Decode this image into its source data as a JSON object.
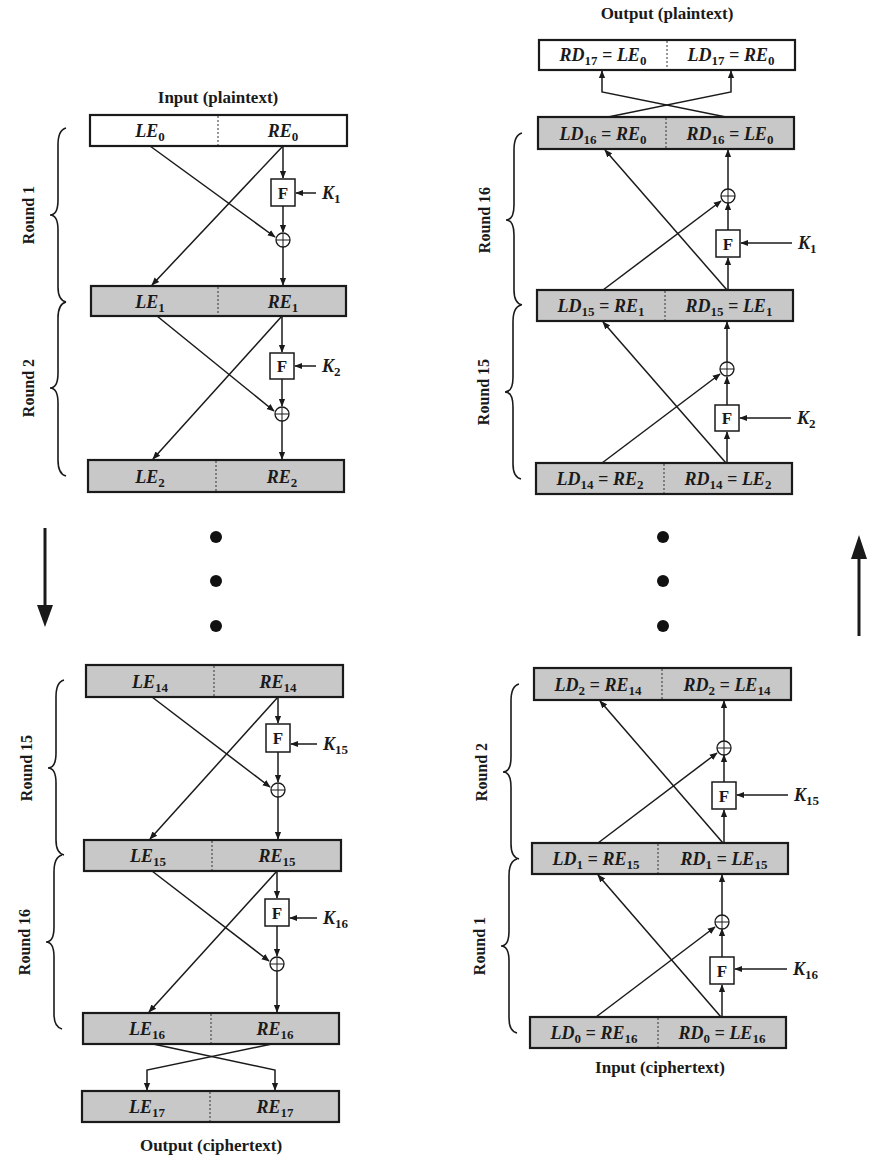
{
  "encryption": {
    "input_label": "Input (plaintext)",
    "output_label": "Output (ciphertext)",
    "direction": "down",
    "blocks": [
      {
        "id": "0",
        "left": "LE",
        "left_sub": "0",
        "right": "RE",
        "right_sub": "0",
        "shaded": false
      },
      {
        "id": "1",
        "left": "LE",
        "left_sub": "1",
        "right": "RE",
        "right_sub": "1",
        "shaded": true
      },
      {
        "id": "2",
        "left": "LE",
        "left_sub": "2",
        "right": "RE",
        "right_sub": "2",
        "shaded": true
      },
      {
        "id": "14",
        "left": "LE",
        "left_sub": "14",
        "right": "RE",
        "right_sub": "14",
        "shaded": true
      },
      {
        "id": "15",
        "left": "LE",
        "left_sub": "15",
        "right": "RE",
        "right_sub": "15",
        "shaded": true
      },
      {
        "id": "16",
        "left": "LE",
        "left_sub": "16",
        "right": "RE",
        "right_sub": "16",
        "shaded": true
      },
      {
        "id": "17",
        "left": "LE",
        "left_sub": "17",
        "right": "RE",
        "right_sub": "17",
        "shaded": true
      }
    ],
    "rounds": [
      {
        "label": "Round 1",
        "key": "K",
        "key_sub": "1"
      },
      {
        "label": "Round 2",
        "key": "K",
        "key_sub": "2"
      },
      {
        "label": "Round 15",
        "key": "K",
        "key_sub": "15"
      },
      {
        "label": "Round 16",
        "key": "K",
        "key_sub": "16"
      }
    ]
  },
  "decryption": {
    "input_label": "Input (ciphertext)",
    "output_label": "Output (plaintext)",
    "direction": "up",
    "blocks": [
      {
        "id": "17",
        "left": "RD",
        "left_sub": "17",
        "left_eq": "LE",
        "left_eq_sub": "0",
        "right": "LD",
        "right_sub": "17",
        "right_eq": "RE",
        "right_eq_sub": "0",
        "shaded": false
      },
      {
        "id": "16",
        "left": "LD",
        "left_sub": "16",
        "left_eq": "RE",
        "left_eq_sub": "0",
        "right": "RD",
        "right_sub": "16",
        "right_eq": "LE",
        "right_eq_sub": "0",
        "shaded": true
      },
      {
        "id": "15",
        "left": "LD",
        "left_sub": "15",
        "left_eq": "RE",
        "left_eq_sub": "1",
        "right": "RD",
        "right_sub": "15",
        "right_eq": "LE",
        "right_eq_sub": "1",
        "shaded": true
      },
      {
        "id": "14",
        "left": "LD",
        "left_sub": "14",
        "left_eq": "RE",
        "left_eq_sub": "2",
        "right": "RD",
        "right_sub": "14",
        "right_eq": "LE",
        "right_eq_sub": "2",
        "shaded": true
      },
      {
        "id": "2",
        "left": "LD",
        "left_sub": "2",
        "left_eq": "RE",
        "left_eq_sub": "14",
        "right": "RD",
        "right_sub": "2",
        "right_eq": "LE",
        "right_eq_sub": "14",
        "shaded": true
      },
      {
        "id": "1",
        "left": "LD",
        "left_sub": "1",
        "left_eq": "RE",
        "left_eq_sub": "15",
        "right": "RD",
        "right_sub": "1",
        "right_eq": "LE",
        "right_eq_sub": "15",
        "shaded": true
      },
      {
        "id": "0",
        "left": "LD",
        "left_sub": "0",
        "left_eq": "RE",
        "left_eq_sub": "16",
        "right": "RD",
        "right_sub": "0",
        "right_eq": "LE",
        "right_eq_sub": "16",
        "shaded": true
      }
    ],
    "rounds": [
      {
        "label": "Round 16",
        "key": "K",
        "key_sub": "1"
      },
      {
        "label": "Round 15",
        "key": "K",
        "key_sub": "2"
      },
      {
        "label": "Round 2",
        "key": "K",
        "key_sub": "15"
      },
      {
        "label": "Round 1",
        "key": "K",
        "key_sub": "16"
      }
    ]
  },
  "symbols": {
    "function_label": "F",
    "xor_icon": "circled-plus",
    "ellipsis": "vertical-dots"
  },
  "colors": {
    "shaded_fill": "#c8c8c8",
    "ink": "#1a1a1a",
    "background": "#ffffff"
  }
}
